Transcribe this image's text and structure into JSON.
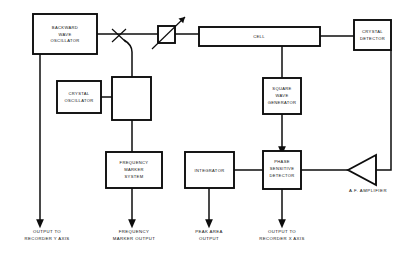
{
  "diagram": {
    "line_color": "#0d0d0d",
    "background": "#ffffff",
    "blocks": [
      {
        "id": "bwo",
        "name": "backward-wave-oscillator",
        "lines": [
          "BACKWARD",
          "WAVE",
          "OSCILLATOR"
        ]
      },
      {
        "id": "cell",
        "name": "cell",
        "lines": [
          "CELL"
        ]
      },
      {
        "id": "crystal_det",
        "name": "crystal-detector",
        "lines": [
          "CRYSTAL",
          "DETECTOR"
        ]
      },
      {
        "id": "crystal_osc",
        "name": "crystal-oscillator",
        "lines": [
          "CRYSTAL",
          "OSCILLATOR"
        ]
      },
      {
        "id": "mixer",
        "name": "mixer",
        "lines": []
      },
      {
        "id": "sq_wave",
        "name": "square-wave-generator",
        "lines": [
          "SQUARE",
          "WAVE",
          "GENERATOR"
        ]
      },
      {
        "id": "freq_mark",
        "name": "frequency-marker-system",
        "lines": [
          "FREQUENCY",
          "MARKER",
          "SYSTEM"
        ]
      },
      {
        "id": "integrator",
        "name": "integrator",
        "lines": [
          "INTEGRATOR"
        ]
      },
      {
        "id": "psd",
        "name": "phase-sensitive-detector",
        "lines": [
          "PHASE",
          "SENSITIVE",
          "DETECTOR"
        ]
      }
    ],
    "symbols": [
      {
        "id": "attenuator",
        "name": "variable-attenuator",
        "type": "square-with-arrow"
      },
      {
        "id": "coupler",
        "name": "directional-coupler",
        "type": "bowtie"
      },
      {
        "id": "af_amp",
        "name": "af-amplifier",
        "type": "triangle",
        "label": "A.F.  AMPLIFIER"
      }
    ],
    "outputs": [
      {
        "id": "out_y",
        "name": "output-recorder-y-axis",
        "lines": [
          "OUTPUT TO",
          "RECORDER Y AXIS"
        ]
      },
      {
        "id": "out_fm",
        "name": "frequency-marker-output",
        "lines": [
          "FREQUENCY",
          "MARKER OUTPUT"
        ]
      },
      {
        "id": "out_peak",
        "name": "peak-area-output",
        "lines": [
          "PEAK AREA",
          "OUTPUT"
        ]
      },
      {
        "id": "out_x",
        "name": "output-recorder-x-axis",
        "lines": [
          "OUTPUT TO",
          "RECORDER X AXIS"
        ]
      }
    ]
  }
}
